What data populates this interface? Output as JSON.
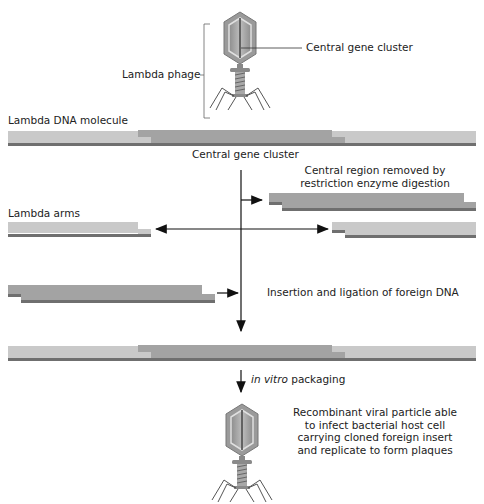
{
  "labels": {
    "central_gene_cluster_top": "Central gene cluster",
    "lambda_phage": "Lambda phage",
    "lambda_dna_molecule": "Lambda DNA molecule",
    "central_gene_cluster_mid": "Central gene cluster",
    "central_region_removed": [
      "Central region removed by",
      "restriction enzyme digestion"
    ],
    "lambda_arms": "Lambda arms",
    "insertion_ligation": "Insertion and ligation of foreign DNA",
    "in_vitro": "in vitro",
    "packaging": " packaging",
    "recombinant": [
      "Recombinant viral particle able",
      "to infect bacterial host cell",
      "carrying cloned foreign insert",
      "and replicate to form plaques"
    ]
  },
  "colors": {
    "arm_light": "#c9c9c9",
    "center_dark": "#a3a3a3",
    "strand_line": "#6f6f6f",
    "phage_body": "#9a9a9a",
    "arrow": "#111111"
  }
}
